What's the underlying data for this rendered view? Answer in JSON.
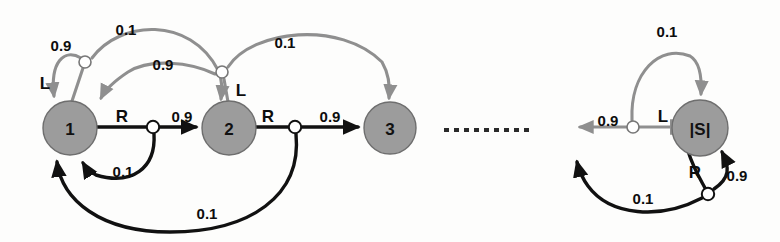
{
  "diagram": {
    "type": "mdp-state-transition-diagram",
    "background_color": "#fdfdfc",
    "state_fill_color": "#9c9c9c",
    "state_stroke_color": "#6e6e6e",
    "left_action_edge_color": "#8f8f8f",
    "right_action_edge_color": "#111111",
    "junction_fill_color": "#ffffff",
    "ellipsis_label": "dashed-continuation",
    "states": [
      {
        "id": "s1",
        "label": "1",
        "cx": 70,
        "cy": 128,
        "r": 27
      },
      {
        "id": "s2",
        "label": "2",
        "cx": 229,
        "cy": 128,
        "r": 27
      },
      {
        "id": "s3",
        "label": "3",
        "cx": 390,
        "cy": 128,
        "r": 26
      },
      {
        "id": "sN",
        "label": "|S|",
        "cx": 700,
        "cy": 128,
        "r": 28
      }
    ],
    "junctions": [
      {
        "id": "j1L",
        "state": "s1",
        "action": "L",
        "cx": 85,
        "cy": 62,
        "r": 6
      },
      {
        "id": "j1R",
        "state": "s1",
        "action": "R",
        "cx": 153,
        "cy": 127,
        "r": 6
      },
      {
        "id": "j2L",
        "state": "s2",
        "action": "L",
        "cx": 222,
        "cy": 72,
        "r": 6
      },
      {
        "id": "j2R",
        "state": "s2",
        "action": "R",
        "cx": 295,
        "cy": 127,
        "r": 6
      },
      {
        "id": "jNL",
        "state": "sN",
        "action": "L",
        "cx": 633,
        "cy": 127,
        "r": 6
      },
      {
        "id": "jNR",
        "state": "sN",
        "action": "R",
        "cx": 708,
        "cy": 194,
        "r": 6
      }
    ],
    "action_labels": [
      {
        "id": "a1L",
        "text": "L",
        "x": 45,
        "y": 83
      },
      {
        "id": "a1R",
        "text": "R",
        "x": 122,
        "y": 116
      },
      {
        "id": "a2L",
        "text": "L",
        "x": 241,
        "y": 90
      },
      {
        "id": "a2R",
        "text": "R",
        "x": 268,
        "y": 116
      },
      {
        "id": "aNL",
        "text": "L",
        "x": 663,
        "y": 116
      },
      {
        "id": "aNR",
        "text": "R",
        "x": 695,
        "y": 172
      }
    ],
    "probability_labels": [
      {
        "id": "p1",
        "text": "0.9",
        "x": 61,
        "y": 45,
        "edge": "s1-L-to-s1"
      },
      {
        "id": "p2",
        "text": "0.1",
        "x": 126,
        "y": 29,
        "edge": "s1-L-to-s2"
      },
      {
        "id": "p3",
        "text": "0.9",
        "x": 163,
        "y": 64,
        "edge": "s2-L-to-s1"
      },
      {
        "id": "p4",
        "text": "0.1",
        "x": 285,
        "y": 42,
        "edge": "s2-L-to-s3"
      },
      {
        "id": "p5",
        "text": "0.9",
        "x": 182,
        "y": 116,
        "edge": "s1-R-to-s2"
      },
      {
        "id": "p6",
        "text": "0.9",
        "x": 330,
        "y": 116,
        "edge": "s2-R-to-s3"
      },
      {
        "id": "p7",
        "text": "0.1",
        "x": 123,
        "y": 171,
        "edge": "s1-R-to-s1"
      },
      {
        "id": "p8",
        "text": "0.1",
        "x": 207,
        "y": 213,
        "edge": "s2-R-to-s1"
      },
      {
        "id": "p9",
        "text": "0.1",
        "x": 667,
        "y": 31,
        "edge": "sN-L-to-sN"
      },
      {
        "id": "p10",
        "text": "0.9",
        "x": 608,
        "y": 120,
        "edge": "sN-L-to-prev"
      },
      {
        "id": "p11",
        "text": "0.9",
        "x": 737,
        "y": 175,
        "edge": "sN-R-to-sN"
      },
      {
        "id": "p12",
        "text": "0.1",
        "x": 643,
        "y": 198,
        "edge": "sN-R-to-prev"
      }
    ],
    "ellipsis": {
      "x_start": 443,
      "x_end": 533,
      "y": 130,
      "dash_count": 10
    },
    "transitions": [
      {
        "from": "1",
        "action": "L",
        "to": "1",
        "probability": 0.9
      },
      {
        "from": "1",
        "action": "L",
        "to": "2",
        "probability": 0.1
      },
      {
        "from": "1",
        "action": "R",
        "to": "2",
        "probability": 0.9
      },
      {
        "from": "1",
        "action": "R",
        "to": "1",
        "probability": 0.1
      },
      {
        "from": "2",
        "action": "L",
        "to": "1",
        "probability": 0.9
      },
      {
        "from": "2",
        "action": "L",
        "to": "3",
        "probability": 0.1
      },
      {
        "from": "2",
        "action": "R",
        "to": "3",
        "probability": 0.9
      },
      {
        "from": "2",
        "action": "R",
        "to": "1",
        "probability": 0.1
      },
      {
        "from": "|S|",
        "action": "L",
        "to": "|S|-1",
        "probability": 0.9
      },
      {
        "from": "|S|",
        "action": "L",
        "to": "|S|",
        "probability": 0.1
      },
      {
        "from": "|S|",
        "action": "R",
        "to": "|S|",
        "probability": 0.9
      },
      {
        "from": "|S|",
        "action": "R",
        "to": "|S|-1",
        "probability": 0.1
      }
    ]
  }
}
